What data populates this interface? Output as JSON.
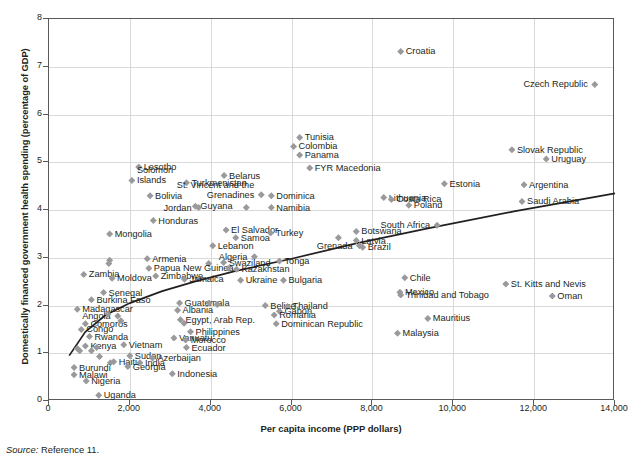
{
  "axes": {
    "x_title": "Per capita income (PPP dollars)",
    "y_title": "Domestically financed government health spending (percentage of GDP)",
    "x_ticks": [
      "0",
      "2,000",
      "4,000",
      "6,000",
      "8,000",
      "10,000",
      "12,000",
      "14,000"
    ],
    "y_ticks": [
      "0",
      "1",
      "2",
      "3",
      "4",
      "5",
      "6",
      "7",
      "8"
    ]
  },
  "source": {
    "prefix": "Source:",
    "text": " Reference 11."
  },
  "colors": {
    "marker": "#9a9a9d",
    "axis": "#58595b",
    "grid": "#d9d9d9",
    "trend": "#231f20"
  },
  "chart_data": {
    "type": "scatter",
    "title": "",
    "xlabel": "Per capita income (PPP dollars)",
    "ylabel": "Domestically financed government health spending (percentage of GDP)",
    "xlim": [
      0,
      14000
    ],
    "ylim": [
      0,
      8
    ],
    "xticks": [
      0,
      2000,
      4000,
      6000,
      8000,
      10000,
      12000,
      14000
    ],
    "yticks": [
      0,
      1,
      2,
      3,
      4,
      5,
      6,
      7,
      8
    ],
    "grid": true,
    "legend": null,
    "trendline": {
      "type": "logarithmic",
      "description": "Fitted curve rising steeply at low income then flattening",
      "points": [
        [
          500,
          0.95
        ],
        [
          900,
          1.45
        ],
        [
          1400,
          1.8
        ],
        [
          2000,
          2.05
        ],
        [
          2800,
          2.3
        ],
        [
          3600,
          2.5
        ],
        [
          4600,
          2.72
        ],
        [
          6000,
          2.98
        ],
        [
          7600,
          3.3
        ],
        [
          9400,
          3.62
        ],
        [
          11500,
          3.97
        ],
        [
          14000,
          4.35
        ]
      ]
    },
    "points": [
      {
        "label": "Croatia",
        "x": 8700,
        "y": 7.32,
        "label_pos": "right"
      },
      {
        "label": "Czech Republic",
        "x": 13500,
        "y": 6.63,
        "label_pos": "left"
      },
      {
        "label": "Tunisia",
        "x": 6200,
        "y": 5.52,
        "label_pos": "right"
      },
      {
        "label": "Colombia",
        "x": 6050,
        "y": 5.33,
        "label_pos": "right"
      },
      {
        "label": "Panama",
        "x": 6200,
        "y": 5.15,
        "label_pos": "right"
      },
      {
        "label": "Slovak Republic",
        "x": 11450,
        "y": 5.26,
        "label_pos": "right"
      },
      {
        "label": "Uruguay",
        "x": 12300,
        "y": 5.07,
        "label_pos": "right"
      },
      {
        "label": "FYR Macedonia",
        "x": 6450,
        "y": 4.88,
        "label_pos": "right"
      },
      {
        "label": "Lesotho",
        "x": 2220,
        "y": 4.9,
        "label_pos": "right"
      },
      {
        "label": "Belarus",
        "x": 4330,
        "y": 4.72,
        "label_pos": "right"
      },
      {
        "label": "Solomon Islands",
        "x": 2050,
        "y": 4.62,
        "label_pos": "right"
      },
      {
        "label": "Turkmenistan",
        "x": 3400,
        "y": 4.57,
        "label_pos": "right"
      },
      {
        "label": "Argentina",
        "x": 11750,
        "y": 4.53,
        "label_pos": "right"
      },
      {
        "label": "Estonia",
        "x": 9780,
        "y": 4.55,
        "label_pos": "right"
      },
      {
        "label": "Bolivia",
        "x": 2500,
        "y": 4.3,
        "label_pos": "right"
      },
      {
        "label": "St. Vincent and the Grenadines",
        "x": 5250,
        "y": 4.32,
        "label_pos": "left"
      },
      {
        "label": "Dominica",
        "x": 5500,
        "y": 4.3,
        "label_pos": "right"
      },
      {
        "label": "Lithuania",
        "x": 8280,
        "y": 4.26,
        "label_pos": "right"
      },
      {
        "label": "Costa Rica",
        "x": 8470,
        "y": 4.22,
        "label_pos": "right"
      },
      {
        "label": "Saudi Arabia",
        "x": 11700,
        "y": 4.18,
        "label_pos": "right"
      },
      {
        "label": "Poland",
        "x": 8900,
        "y": 4.1,
        "label_pos": "right"
      },
      {
        "label": "Guyana",
        "x": 3620,
        "y": 4.08,
        "label_pos": "right"
      },
      {
        "label": "Jordan",
        "x": 3700,
        "y": 4.05,
        "label_pos": "left"
      },
      {
        "label": "Namibia",
        "x": 5500,
        "y": 4.05,
        "label_pos": "right"
      },
      {
        "label": "",
        "x": 4880,
        "y": 4.05,
        "label_pos": "none"
      },
      {
        "label": "Honduras",
        "x": 2580,
        "y": 3.78,
        "label_pos": "right"
      },
      {
        "label": "South Africa",
        "x": 9600,
        "y": 3.68,
        "label_pos": "left"
      },
      {
        "label": "Botswana",
        "x": 7600,
        "y": 3.55,
        "label_pos": "right"
      },
      {
        "label": "El Salvador",
        "x": 4380,
        "y": 3.58,
        "label_pos": "right"
      },
      {
        "label": "Turkey",
        "x": 5480,
        "y": 3.52,
        "label_pos": "right"
      },
      {
        "label": "Mongolia",
        "x": 1500,
        "y": 3.5,
        "label_pos": "right"
      },
      {
        "label": "Samoa",
        "x": 4620,
        "y": 3.42,
        "label_pos": "right"
      },
      {
        "label": "",
        "x": 7160,
        "y": 3.42,
        "label_pos": "none"
      },
      {
        "label": "Latvia",
        "x": 7600,
        "y": 3.36,
        "label_pos": "right"
      },
      {
        "label": "Grenada",
        "x": 7680,
        "y": 3.25,
        "label_pos": "left"
      },
      {
        "label": "Brazil",
        "x": 7760,
        "y": 3.22,
        "label_pos": "right"
      },
      {
        "label": "Lebanon",
        "x": 4050,
        "y": 3.25,
        "label_pos": "right"
      },
      {
        "label": "Algeria",
        "x": 5080,
        "y": 3.02,
        "label_pos": "left"
      },
      {
        "label": "Armenia",
        "x": 2430,
        "y": 2.98,
        "label_pos": "right"
      },
      {
        "label": "Tonga",
        "x": 5700,
        "y": 2.93,
        "label_pos": "right"
      },
      {
        "label": "Swaziland",
        "x": 4320,
        "y": 2.9,
        "label_pos": "right"
      },
      {
        "label": "",
        "x": 1500,
        "y": 2.95,
        "label_pos": "none"
      },
      {
        "label": "",
        "x": 1480,
        "y": 2.88,
        "label_pos": "none"
      },
      {
        "label": "",
        "x": 3950,
        "y": 2.88,
        "label_pos": "none"
      },
      {
        "label": "Papua New Guinea",
        "x": 2470,
        "y": 2.78,
        "label_pos": "right"
      },
      {
        "label": "Kazakhstan",
        "x": 4640,
        "y": 2.76,
        "label_pos": "right"
      },
      {
        "label": "",
        "x": 4440,
        "y": 2.78,
        "label_pos": "none"
      },
      {
        "label": "Zimbabwe",
        "x": 2640,
        "y": 2.62,
        "label_pos": "right"
      },
      {
        "label": "Zambia",
        "x": 860,
        "y": 2.65,
        "label_pos": "right"
      },
      {
        "label": "Moldova",
        "x": 1560,
        "y": 2.57,
        "label_pos": "right"
      },
      {
        "label": "Jamaica",
        "x": 3350,
        "y": 2.55,
        "label_pos": "right"
      },
      {
        "label": "Ukraine",
        "x": 4740,
        "y": 2.53,
        "label_pos": "right"
      },
      {
        "label": "Bulgaria",
        "x": 5800,
        "y": 2.53,
        "label_pos": "right"
      },
      {
        "label": "Chile",
        "x": 8800,
        "y": 2.58,
        "label_pos": "right"
      },
      {
        "label": "St. Kitts and Nevis",
        "x": 11300,
        "y": 2.45,
        "label_pos": "right"
      },
      {
        "label": "Senegal",
        "x": 1350,
        "y": 2.27,
        "label_pos": "right"
      },
      {
        "label": "Mexico",
        "x": 8680,
        "y": 2.28,
        "label_pos": "right"
      },
      {
        "label": "Trinidad and Tobago",
        "x": 8700,
        "y": 2.22,
        "label_pos": "right"
      },
      {
        "label": "Oman",
        "x": 12450,
        "y": 2.2,
        "label_pos": "right"
      },
      {
        "label": "Burkina Faso",
        "x": 1050,
        "y": 2.12,
        "label_pos": "right"
      },
      {
        "label": "Guatemala",
        "x": 3230,
        "y": 2.05,
        "label_pos": "right"
      },
      {
        "label": "",
        "x": 3960,
        "y": 2.05,
        "label_pos": "none"
      },
      {
        "label": "",
        "x": 4160,
        "y": 2.02,
        "label_pos": "none"
      },
      {
        "label": "Belize",
        "x": 5350,
        "y": 2.0,
        "label_pos": "right"
      },
      {
        "label": "Thailand",
        "x": 5900,
        "y": 1.98,
        "label_pos": "right"
      },
      {
        "label": "Madagascar",
        "x": 700,
        "y": 1.92,
        "label_pos": "right"
      },
      {
        "label": "Albania",
        "x": 3180,
        "y": 1.9,
        "label_pos": "right"
      },
      {
        "label": "Gabon",
        "x": 5700,
        "y": 1.88,
        "label_pos": "right"
      },
      {
        "label": "Romania",
        "x": 5570,
        "y": 1.8,
        "label_pos": "right"
      },
      {
        "label": "Angola",
        "x": 1700,
        "y": 1.78,
        "label_pos": "left"
      },
      {
        "label": "",
        "x": 1460,
        "y": 1.82,
        "label_pos": "none"
      },
      {
        "label": "Mauritius",
        "x": 9370,
        "y": 1.73,
        "label_pos": "right"
      },
      {
        "label": "Egypt, Arab Rep.",
        "x": 3250,
        "y": 1.7,
        "label_pos": "right"
      },
      {
        "label": "Comoros",
        "x": 900,
        "y": 1.62,
        "label_pos": "right"
      },
      {
        "label": "Dominican Republic",
        "x": 5620,
        "y": 1.62,
        "label_pos": "right"
      },
      {
        "label": "",
        "x": 3340,
        "y": 1.63,
        "label_pos": "none"
      },
      {
        "label": "",
        "x": 1780,
        "y": 1.68,
        "label_pos": "none"
      },
      {
        "label": "Congo",
        "x": 800,
        "y": 1.5,
        "label_pos": "right"
      },
      {
        "label": "Philippines",
        "x": 3500,
        "y": 1.45,
        "label_pos": "right"
      },
      {
        "label": "Malaysia",
        "x": 8620,
        "y": 1.42,
        "label_pos": "right"
      },
      {
        "label": "Vanuatu",
        "x": 3090,
        "y": 1.32,
        "label_pos": "right"
      },
      {
        "label": "Rwanda",
        "x": 1000,
        "y": 1.35,
        "label_pos": "right"
      },
      {
        "label": "Morocco",
        "x": 3380,
        "y": 1.28,
        "label_pos": "right"
      },
      {
        "label": "Kenya",
        "x": 900,
        "y": 1.15,
        "label_pos": "right"
      },
      {
        "label": "Vietnam",
        "x": 1850,
        "y": 1.18,
        "label_pos": "right"
      },
      {
        "label": "Ecuador",
        "x": 3400,
        "y": 1.12,
        "label_pos": "right"
      },
      {
        "label": "",
        "x": 700,
        "y": 1.1,
        "label_pos": "none"
      },
      {
        "label": "",
        "x": 760,
        "y": 1.05,
        "label_pos": "none"
      },
      {
        "label": "",
        "x": 1050,
        "y": 1.05,
        "label_pos": "none"
      },
      {
        "label": "",
        "x": 1180,
        "y": 1.12,
        "label_pos": "none"
      },
      {
        "label": "Sudan",
        "x": 2000,
        "y": 0.95,
        "label_pos": "right"
      },
      {
        "label": "",
        "x": 1250,
        "y": 0.93,
        "label_pos": "none"
      },
      {
        "label": "Azerbaijan",
        "x": 2560,
        "y": 0.9,
        "label_pos": "right"
      },
      {
        "label": "Haiti",
        "x": 1600,
        "y": 0.82,
        "label_pos": "right"
      },
      {
        "label": "India",
        "x": 2250,
        "y": 0.8,
        "label_pos": "right"
      },
      {
        "label": "",
        "x": 1520,
        "y": 0.8,
        "label_pos": "none"
      },
      {
        "label": "Georgia",
        "x": 1950,
        "y": 0.72,
        "label_pos": "right"
      },
      {
        "label": "Burundi",
        "x": 620,
        "y": 0.7,
        "label_pos": "right"
      },
      {
        "label": "Indonesia",
        "x": 3050,
        "y": 0.57,
        "label_pos": "right"
      },
      {
        "label": "Malawi",
        "x": 620,
        "y": 0.55,
        "label_pos": "right"
      },
      {
        "label": "Nigeria",
        "x": 920,
        "y": 0.42,
        "label_pos": "right"
      },
      {
        "label": "Uganda",
        "x": 1230,
        "y": 0.12,
        "label_pos": "right"
      }
    ]
  }
}
